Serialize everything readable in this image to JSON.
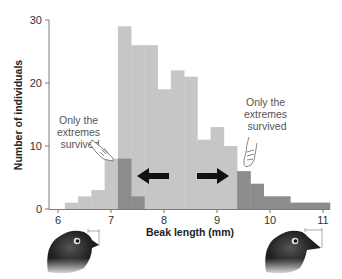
{
  "chart_data": {
    "type": "bar",
    "title": "",
    "xlabel": "Beak length (mm)",
    "ylabel": "Number of individuals",
    "xlim": [
      6,
      11.15
    ],
    "ylim": [
      0,
      30
    ],
    "xticks": [
      "6",
      "7",
      "8",
      "9",
      "10",
      "11"
    ],
    "yticks": [
      "0",
      "10",
      "20",
      "30"
    ],
    "grid": false,
    "legend": null,
    "bin_width_mm": 0.25,
    "series": [
      {
        "name": "Population",
        "color": "#c6c6c6",
        "bins": [
          {
            "start": 6.13,
            "end": 6.38,
            "value": 1
          },
          {
            "start": 6.38,
            "end": 6.63,
            "value": 2
          },
          {
            "start": 6.63,
            "end": 6.88,
            "value": 3
          },
          {
            "start": 6.88,
            "end": 7.13,
            "value": 8
          },
          {
            "start": 7.13,
            "end": 7.38,
            "value": 29
          },
          {
            "start": 7.38,
            "end": 7.63,
            "value": 26
          },
          {
            "start": 7.63,
            "end": 7.88,
            "value": 26
          },
          {
            "start": 7.88,
            "end": 8.13,
            "value": 19
          },
          {
            "start": 8.13,
            "end": 8.38,
            "value": 22
          },
          {
            "start": 8.38,
            "end": 8.63,
            "value": 21
          },
          {
            "start": 8.63,
            "end": 8.88,
            "value": 11
          },
          {
            "start": 8.88,
            "end": 9.13,
            "value": 13
          },
          {
            "start": 9.13,
            "end": 9.38,
            "value": 10
          },
          {
            "start": 9.38,
            "end": 9.63,
            "value": 6
          },
          {
            "start": 9.63,
            "end": 9.88,
            "value": 4
          },
          {
            "start": 9.88,
            "end": 10.13,
            "value": 2
          },
          {
            "start": 10.13,
            "end": 10.38,
            "value": 2
          },
          {
            "start": 10.38,
            "end": 10.63,
            "value": 1
          },
          {
            "start": 10.63,
            "end": 10.88,
            "value": 1
          },
          {
            "start": 10.88,
            "end": 11.13,
            "value": 1
          }
        ]
      },
      {
        "name": "Survivors (extremes)",
        "color": "#8c8c8c",
        "bins": [
          {
            "start": 7.13,
            "end": 7.38,
            "value": 8
          },
          {
            "start": 7.38,
            "end": 7.63,
            "value": 2
          },
          {
            "start": 9.38,
            "end": 9.63,
            "value": 6
          },
          {
            "start": 9.63,
            "end": 9.88,
            "value": 4
          },
          {
            "start": 9.88,
            "end": 10.38,
            "value": 2
          },
          {
            "start": 10.38,
            "end": 11.13,
            "value": 1
          }
        ]
      }
    ],
    "annotations": [
      {
        "text": [
          "Only the",
          "extremes",
          "survived"
        ],
        "position": "left",
        "pointer": "hand-pointing-icon"
      },
      {
        "text": [
          "Only the",
          "extremes",
          "survived"
        ],
        "position": "right",
        "pointer": "hand-pointing-icon"
      },
      {
        "type": "arrow",
        "direction": "left"
      },
      {
        "type": "arrow",
        "direction": "right"
      }
    ],
    "illustrations": [
      {
        "name": "short-beak-finch",
        "position": "below-left"
      },
      {
        "name": "long-beak-finch",
        "position": "below-right"
      }
    ]
  },
  "labels": {
    "ylabel": "Number of individuals",
    "xlabel": "Beak length (mm)",
    "annot_left": [
      "Only the",
      "extremes",
      "survived"
    ],
    "annot_right": [
      "Only the",
      "extremes",
      "survived"
    ],
    "xticks": [
      "6",
      "7",
      "8",
      "9",
      "10",
      "11"
    ],
    "yticks": [
      "0",
      "10",
      "20",
      "30"
    ]
  },
  "colors": {
    "population": "#c6c6c6",
    "survivors": "#8c8c8c",
    "axis": "#7a7a7a",
    "arrow": "#111111"
  }
}
